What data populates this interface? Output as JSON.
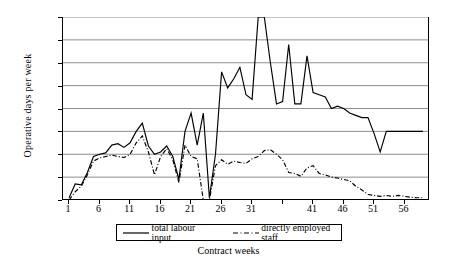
{
  "chart_data": {
    "type": "line",
    "title": "",
    "xlabel": "Contract weeks",
    "ylabel": "Operative days per week",
    "xlim": [
      0,
      60
    ],
    "ylim": [
      0,
      400
    ],
    "grid": true,
    "legend_position": "bottom",
    "y_ticks": [
      0,
      50,
      100,
      150,
      200,
      250,
      300,
      350,
      400
    ],
    "x_ticks": [
      1,
      6,
      11,
      16,
      21,
      26,
      31,
      41,
      46,
      51,
      56
    ],
    "x_tick_positions": [
      1,
      6,
      11,
      16,
      21,
      26,
      31,
      36,
      41,
      46,
      51,
      56
    ],
    "x": [
      1,
      2,
      3,
      4,
      5,
      6,
      7,
      8,
      9,
      10,
      11,
      12,
      13,
      14,
      15,
      16,
      17,
      18,
      19,
      20,
      21,
      22,
      23,
      24,
      25,
      26,
      27,
      28,
      29,
      30,
      31,
      32,
      33,
      34,
      35,
      36,
      37,
      38,
      39,
      40,
      41,
      42,
      43,
      44,
      45,
      46,
      47,
      48,
      49,
      50,
      51,
      52,
      53,
      54,
      55,
      56,
      57,
      58,
      59
    ],
    "series": [
      {
        "name": "total labour input",
        "style": "solid",
        "color": "#000000",
        "values": [
          5,
          35,
          33,
          60,
          95,
          100,
          103,
          120,
          123,
          115,
          125,
          150,
          168,
          118,
          100,
          105,
          118,
          95,
          45,
          150,
          190,
          120,
          190,
          5,
          100,
          280,
          245,
          265,
          290,
          230,
          220,
          400,
          400,
          300,
          210,
          215,
          340,
          210,
          210,
          315,
          235,
          230,
          225,
          200,
          205,
          200,
          190,
          185,
          180,
          180,
          145,
          105,
          150,
          150,
          150,
          150,
          150,
          150,
          150
        ]
      },
      {
        "name": "directly employed staff",
        "style": "dash-dot",
        "color": "#000000",
        "values": [
          0,
          18,
          30,
          55,
          85,
          92,
          95,
          98,
          95,
          93,
          100,
          125,
          140,
          105,
          55,
          95,
          112,
          88,
          38,
          120,
          95,
          90,
          0,
          0,
          75,
          88,
          78,
          85,
          82,
          80,
          90,
          95,
          108,
          110,
          100,
          88,
          60,
          58,
          52,
          70,
          75,
          58,
          55,
          50,
          48,
          45,
          42,
          30,
          22,
          12,
          10,
          8,
          10,
          8,
          10,
          8,
          6,
          5,
          5
        ]
      }
    ]
  },
  "axis": {
    "y_title": "Operative days per week",
    "x_title": "Contract weeks",
    "y_tick_labels": [
      "0",
      "50",
      "100",
      "150",
      "200",
      "250",
      "300",
      "350",
      "400"
    ],
    "x_tick_labels": [
      "1",
      "6",
      "11",
      "16",
      "21",
      "26",
      "31",
      "41",
      "46",
      "51",
      "56"
    ]
  },
  "legend": {
    "entries": [
      {
        "label": "total labour input",
        "style": "solid"
      },
      {
        "label": "directly employed staff",
        "style": "dash-dot"
      }
    ]
  }
}
